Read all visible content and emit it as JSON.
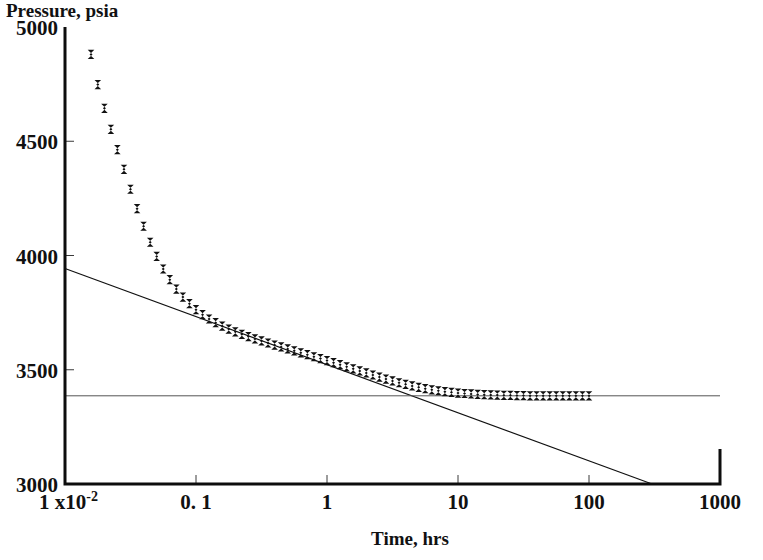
{
  "chart_data": {
    "type": "scatter",
    "title": "Pressure, psia",
    "xlabel": "Time, hrs",
    "ylabel": "Pressure, psia",
    "xscale": "log",
    "yscale": "linear",
    "xlim": [
      0.01,
      1000
    ],
    "ylim": [
      3000,
      5000
    ],
    "grid": false,
    "legend": null,
    "x_ticks": [
      {
        "value": 0.01,
        "label": "1 x10",
        "superscript": "-2"
      },
      {
        "value": 0.1,
        "label": "0. 1",
        "superscript": ""
      },
      {
        "value": 1,
        "label": "1",
        "superscript": ""
      },
      {
        "value": 10,
        "label": "10",
        "superscript": ""
      },
      {
        "value": 100,
        "label": "100",
        "superscript": ""
      },
      {
        "value": 1000,
        "label": "1000",
        "superscript": ""
      }
    ],
    "y_ticks": [
      {
        "value": 5000,
        "label": "5000"
      },
      {
        "value": 4500,
        "label": "4500"
      },
      {
        "value": 4000,
        "label": "4000"
      },
      {
        "value": 3500,
        "label": "3500"
      },
      {
        "value": 3000,
        "label": "3000"
      }
    ],
    "series": [
      {
        "name": "Pressure buildup data",
        "marker": "x",
        "x": [
          0.0158,
          0.0178,
          0.02,
          0.0224,
          0.0251,
          0.0282,
          0.0316,
          0.0355,
          0.0398,
          0.0447,
          0.0501,
          0.0562,
          0.0631,
          0.0708,
          0.0794,
          0.0891,
          0.1,
          0.1122,
          0.1259,
          0.1413,
          0.1585,
          0.1778,
          0.1995,
          0.2239,
          0.2512,
          0.2818,
          0.3162,
          0.3548,
          0.3981,
          0.4467,
          0.5012,
          0.5623,
          0.631,
          0.7079,
          0.7943,
          0.8913,
          1.0,
          1.122,
          1.259,
          1.413,
          1.585,
          1.778,
          1.995,
          2.239,
          2.512,
          2.818,
          3.162,
          3.548,
          3.981,
          4.467,
          5.012,
          5.623,
          6.31,
          7.079,
          7.943,
          8.913,
          10.0,
          11.22,
          12.59,
          14.13,
          15.85,
          17.78,
          19.95,
          22.39,
          25.12,
          28.18,
          31.62,
          35.48,
          39.81,
          44.67,
          50.12,
          56.23,
          63.1,
          70.79,
          79.43,
          89.13,
          100.0
        ],
        "y": [
          4880,
          4748,
          4644,
          4552,
          4463,
          4377,
          4290,
          4205,
          4128,
          4058,
          3996,
          3941,
          3894,
          3853,
          3818,
          3789,
          3763,
          3741,
          3722,
          3706,
          3691,
          3678,
          3666,
          3655,
          3645,
          3635,
          3626,
          3617,
          3608,
          3600,
          3591,
          3583,
          3574,
          3566,
          3557,
          3549,
          3540,
          3531,
          3522,
          3513,
          3504,
          3495,
          3486,
          3477,
          3468,
          3459,
          3451,
          3443,
          3436,
          3429,
          3423,
          3417,
          3412,
          3408,
          3404,
          3401,
          3398,
          3396,
          3394,
          3392,
          3391,
          3390,
          3389,
          3388,
          3388,
          3387,
          3387,
          3386,
          3386,
          3386,
          3386,
          3386,
          3386,
          3386,
          3386,
          3386,
          3386
        ]
      }
    ],
    "annotations": [
      {
        "name": "semilog-straight-line",
        "type": "line",
        "description": "Semilog straight-line fit through middle-time data",
        "points": [
          [
            0.01,
            3943
          ],
          [
            303,
            3000
          ]
        ]
      },
      {
        "name": "average-reservoir-pressure-line",
        "type": "hline",
        "description": "Horizontal asymptote at late-time stabilized pressure",
        "y": 3386,
        "x_start": 0.01,
        "x_end": 1000
      }
    ]
  }
}
